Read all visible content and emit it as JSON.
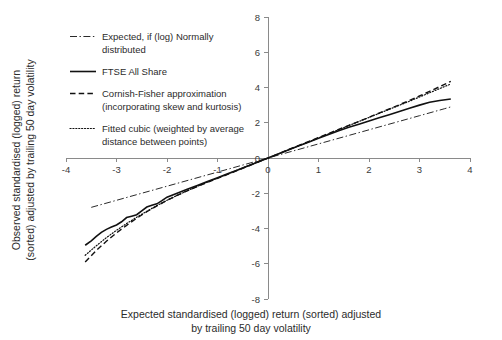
{
  "chart_data": {
    "type": "line",
    "title": "",
    "xlabel": "Expected standardised (logged) return (sorted) adjusted by trailing 50 day volatility",
    "xlabel_line1": "Expected standardised (logged) return (sorted) adjusted",
    "xlabel_line2": "by trailing 50 day volatility",
    "ylabel": "Observed standardised (logged) return (sorted) adjusted by trailing 50 day volatility",
    "ylabel_line1": "Observed standardised (logged) return",
    "ylabel_line2": "(sorted) adjusted by trailing 50 day volatility",
    "xlim": [
      -4,
      4
    ],
    "ylim": [
      -8,
      8
    ],
    "xticks": [
      -4,
      -3,
      -2,
      -1,
      0,
      1,
      2,
      3,
      4
    ],
    "xtick_labels": [
      "-4",
      "-3",
      "-2",
      "-1",
      "0",
      "1",
      "2",
      "3",
      "4"
    ],
    "yticks": [
      -8,
      -6,
      -4,
      -2,
      0,
      2,
      4,
      6,
      8
    ],
    "ytick_labels": [
      "-8",
      "-6",
      "-4",
      "-2",
      "0",
      "2",
      "4",
      "6",
      "8"
    ],
    "grid": false,
    "legend_position": "upper-left",
    "axis_color": "#8a8a8a",
    "series": [
      {
        "name": "Expected, if (log) Normally distributed",
        "label_line1": "Expected, if (log) Normally",
        "label_line2": "distributed",
        "style": "dashdot",
        "color": "#2a2a2a",
        "x": [
          -3.5,
          -3.0,
          -2.5,
          -2.0,
          -1.5,
          -1.0,
          -0.5,
          0.0,
          0.5,
          1.0,
          1.5,
          2.0,
          2.5,
          3.0,
          3.5,
          3.62
        ],
        "y": [
          -2.8,
          -2.4,
          -2.0,
          -1.6,
          -1.2,
          -0.8,
          -0.4,
          0.0,
          0.4,
          0.8,
          1.2,
          1.6,
          2.0,
          2.4,
          2.8,
          2.9
        ]
      },
      {
        "name": "FTSE All Share",
        "label_line1": "FTSE All Share",
        "label_line2": "",
        "style": "solid",
        "color": "#111111",
        "x": [
          -3.62,
          -3.5,
          -3.4,
          -3.3,
          -3.2,
          -3.1,
          -3.0,
          -2.9,
          -2.8,
          -2.7,
          -2.6,
          -2.5,
          -2.4,
          -2.3,
          -2.2,
          -2.1,
          -2.0,
          -1.8,
          -1.6,
          -1.4,
          -1.2,
          -1.0,
          -0.8,
          -0.6,
          -0.4,
          -0.2,
          0.0,
          0.2,
          0.4,
          0.6,
          0.8,
          1.0,
          1.2,
          1.4,
          1.6,
          1.8,
          2.0,
          2.2,
          2.4,
          2.6,
          2.8,
          3.0,
          3.2,
          3.4,
          3.62
        ],
        "y": [
          -4.95,
          -4.7,
          -4.45,
          -4.22,
          -4.05,
          -3.92,
          -3.8,
          -3.62,
          -3.38,
          -3.3,
          -3.22,
          -3.0,
          -2.78,
          -2.68,
          -2.6,
          -2.42,
          -2.22,
          -2.0,
          -1.78,
          -1.56,
          -1.34,
          -1.12,
          -0.9,
          -0.68,
          -0.46,
          -0.23,
          0.0,
          0.23,
          0.46,
          0.68,
          0.9,
          1.12,
          1.34,
          1.55,
          1.74,
          1.92,
          2.1,
          2.28,
          2.46,
          2.64,
          2.82,
          3.0,
          3.16,
          3.26,
          3.35
        ]
      },
      {
        "name": "Cornish-Fisher approximation (incorporating skew and kurtosis)",
        "label_line1": "Cornish-Fisher approximation",
        "label_line2": "(incorporating skew and kurtosis)",
        "style": "dashed",
        "color": "#111111",
        "x": [
          -3.62,
          -3.4,
          -3.2,
          -3.0,
          -2.8,
          -2.6,
          -2.4,
          -2.2,
          -2.0,
          -1.8,
          -1.6,
          -1.4,
          -1.2,
          -1.0,
          -0.8,
          -0.6,
          -0.4,
          -0.2,
          0.0,
          0.2,
          0.4,
          0.6,
          0.8,
          1.0,
          1.2,
          1.4,
          1.6,
          1.8,
          2.0,
          2.2,
          2.4,
          2.6,
          2.8,
          3.0,
          3.2,
          3.4,
          3.62
        ],
        "y": [
          -5.9,
          -5.25,
          -4.72,
          -4.25,
          -3.82,
          -3.42,
          -3.05,
          -2.72,
          -2.4,
          -2.12,
          -1.86,
          -1.62,
          -1.39,
          -1.16,
          -0.93,
          -0.7,
          -0.47,
          -0.23,
          0.0,
          0.23,
          0.47,
          0.7,
          0.93,
          1.16,
          1.39,
          1.62,
          1.85,
          2.08,
          2.31,
          2.55,
          2.78,
          3.02,
          3.27,
          3.52,
          3.78,
          4.05,
          4.35
        ]
      },
      {
        "name": "Fitted cubic (weighted by average distance between points)",
        "label_line1": "Fitted cubic (weighted by average",
        "label_line2": "distance between points)",
        "style": "dotted",
        "color": "#111111",
        "x": [
          -3.62,
          -3.4,
          -3.2,
          -3.0,
          -2.8,
          -2.6,
          -2.4,
          -2.2,
          -2.0,
          -1.8,
          -1.6,
          -1.4,
          -1.2,
          -1.0,
          -0.8,
          -0.6,
          -0.4,
          -0.2,
          0.0,
          0.2,
          0.4,
          0.6,
          0.8,
          1.0,
          1.2,
          1.4,
          1.6,
          1.8,
          2.0,
          2.2,
          2.4,
          2.6,
          2.8,
          3.0,
          3.2,
          3.4,
          3.62
        ],
        "y": [
          -5.52,
          -4.98,
          -4.52,
          -4.1,
          -3.72,
          -3.36,
          -3.02,
          -2.7,
          -2.4,
          -2.12,
          -1.86,
          -1.61,
          -1.37,
          -1.14,
          -0.91,
          -0.68,
          -0.45,
          -0.22,
          0.0,
          0.22,
          0.45,
          0.68,
          0.91,
          1.14,
          1.37,
          1.61,
          1.84,
          2.07,
          2.3,
          2.53,
          2.76,
          2.99,
          3.22,
          3.46,
          3.7,
          3.94,
          4.2
        ]
      }
    ]
  },
  "legend": {
    "items": [
      {
        "label_line1": "Expected, if (log) Normally",
        "label_line2": "distributed",
        "style": "dashdot"
      },
      {
        "label_line1": "FTSE All Share",
        "label_line2": "",
        "style": "solid"
      },
      {
        "label_line1": "Cornish-Fisher approximation",
        "label_line2": "(incorporating skew and kurtosis)",
        "style": "dashed"
      },
      {
        "label_line1": "Fitted cubic (weighted by average",
        "label_line2": "distance between points)",
        "style": "dotted"
      }
    ]
  }
}
